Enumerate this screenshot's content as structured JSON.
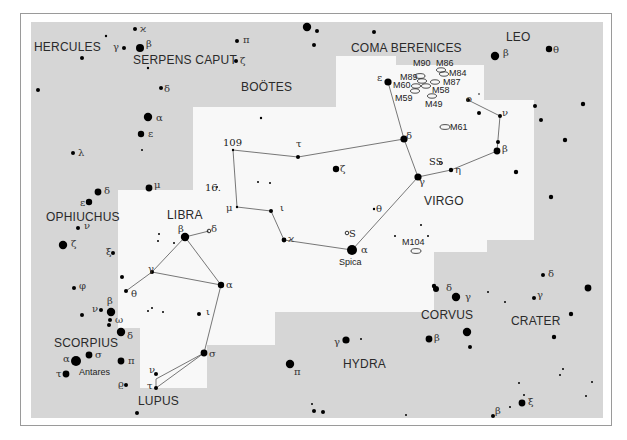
{
  "map": {
    "type": "star-chart",
    "region": "Virgo and Libra",
    "colors": {
      "background_sky": "#d6d6d6",
      "highlight_region": "#f8f8f8",
      "star": "#000000",
      "line": "#555555",
      "label": "#2a2a2a",
      "frame": "#9a9a9a"
    },
    "constellations": [
      {
        "name": "HERCULES",
        "x": 34,
        "y": 50
      },
      {
        "name": "SERPENS CAPUT",
        "x": 132,
        "y": 63
      },
      {
        "name": "BOÖTES",
        "x": 241,
        "y": 90
      },
      {
        "name": "COMA BERENICES",
        "x": 350,
        "y": 52
      },
      {
        "name": "LEO",
        "x": 505,
        "y": 40
      },
      {
        "name": "OPHIUCHUS",
        "x": 46,
        "y": 220
      },
      {
        "name": "LIBRA",
        "x": 167,
        "y": 218
      },
      {
        "name": "VIRGO",
        "x": 424,
        "y": 204
      },
      {
        "name": "SCORPIUS",
        "x": 54,
        "y": 346
      },
      {
        "name": "CORVUS",
        "x": 422,
        "y": 318
      },
      {
        "name": "CRATER",
        "x": 510,
        "y": 324
      },
      {
        "name": "HYDRA",
        "x": 343,
        "y": 367
      },
      {
        "name": "LUPUS",
        "x": 138,
        "y": 405
      }
    ],
    "star_labels": [
      {
        "text": "ϰ",
        "x": 140,
        "y": 32
      },
      {
        "text": "γ",
        "x": 113,
        "y": 50
      },
      {
        "text": "β",
        "x": 146,
        "y": 47
      },
      {
        "text": "π",
        "x": 243,
        "y": 43
      },
      {
        "text": "ζ",
        "x": 240,
        "y": 64
      },
      {
        "text": "δ",
        "x": 164,
        "y": 92
      },
      {
        "text": "α",
        "x": 156,
        "y": 121
      },
      {
        "text": "ε",
        "x": 148,
        "y": 137
      },
      {
        "text": "λ",
        "x": 78,
        "y": 156
      },
      {
        "text": "δ",
        "x": 104,
        "y": 194
      },
      {
        "text": "μ",
        "x": 154,
        "y": 188
      },
      {
        "text": "ε",
        "x": 80,
        "y": 206
      },
      {
        "text": "ν",
        "x": 84,
        "y": 229
      },
      {
        "text": "ζ",
        "x": 71,
        "y": 247
      },
      {
        "text": "ξ",
        "x": 106,
        "y": 255
      },
      {
        "text": "φ",
        "x": 79,
        "y": 289
      },
      {
        "text": "β",
        "x": 178,
        "y": 232
      },
      {
        "text": "δ",
        "x": 211,
        "y": 232
      },
      {
        "text": "γ",
        "x": 148,
        "y": 272
      },
      {
        "text": "θ",
        "x": 131,
        "y": 297
      },
      {
        "text": "α",
        "x": 226,
        "y": 288
      },
      {
        "text": "ι",
        "x": 206,
        "y": 315
      },
      {
        "text": "σ",
        "x": 209,
        "y": 357
      },
      {
        "text": "ν",
        "x": 149,
        "y": 373
      },
      {
        "text": "τ",
        "x": 147,
        "y": 389
      },
      {
        "text": "β",
        "x": 107,
        "y": 304
      },
      {
        "text": "ν",
        "x": 92,
        "y": 312
      },
      {
        "text": "ω",
        "x": 115,
        "y": 323
      },
      {
        "text": "δ",
        "x": 127,
        "y": 339
      },
      {
        "text": "σ",
        "x": 95,
        "y": 358
      },
      {
        "text": "α",
        "x": 63,
        "y": 362
      },
      {
        "text": "τ",
        "x": 56,
        "y": 377
      },
      {
        "text": "π",
        "x": 128,
        "y": 364
      },
      {
        "text": "ϱ",
        "x": 118,
        "y": 387
      },
      {
        "text": "109",
        "x": 223,
        "y": 146
      },
      {
        "text": "16.",
        "x": 205,
        "y": 191
      },
      {
        "text": "μ",
        "x": 226,
        "y": 211
      },
      {
        "text": "ι",
        "x": 280,
        "y": 211
      },
      {
        "text": "ϰ",
        "x": 288,
        "y": 242
      },
      {
        "text": "τ",
        "x": 296,
        "y": 147
      },
      {
        "text": "ζ",
        "x": 340,
        "y": 172
      },
      {
        "text": "θ",
        "x": 376,
        "y": 212
      },
      {
        "text": "S",
        "x": 349,
        "y": 237
      },
      {
        "text": "α",
        "x": 361,
        "y": 253
      },
      {
        "text": "ε",
        "x": 377,
        "y": 81
      },
      {
        "text": "δ",
        "x": 406,
        "y": 139
      },
      {
        "text": "γ",
        "x": 419,
        "y": 185
      },
      {
        "text": "SS",
        "x": 429,
        "y": 165
      },
      {
        "text": "η",
        "x": 455,
        "y": 173
      },
      {
        "text": "β",
        "x": 502,
        "y": 152
      },
      {
        "text": "ν",
        "x": 502,
        "y": 116
      },
      {
        "text": "ο",
        "x": 466,
        "y": 102
      },
      {
        "text": "β",
        "x": 503,
        "y": 56
      },
      {
        "text": "θ",
        "x": 553,
        "y": 53
      },
      {
        "text": "δ",
        "x": 446,
        "y": 291
      },
      {
        "text": "γ",
        "x": 465,
        "y": 300
      },
      {
        "text": "β",
        "x": 434,
        "y": 341
      },
      {
        "text": "δ",
        "x": 548,
        "y": 277
      },
      {
        "text": "γ",
        "x": 537,
        "y": 298
      },
      {
        "text": "γ",
        "x": 334,
        "y": 345
      },
      {
        "text": "π",
        "x": 294,
        "y": 375
      },
      {
        "text": "β",
        "x": 495,
        "y": 414
      },
      {
        "text": "ξ",
        "x": 528,
        "y": 405
      }
    ],
    "named_stars": [
      {
        "name": "Spica",
        "x": 339,
        "y": 264
      },
      {
        "name": "Antares",
        "x": 79,
        "y": 374
      }
    ],
    "deep_sky_objects": [
      {
        "label": "M90",
        "x": 413,
        "y": 66
      },
      {
        "label": "M86",
        "x": 436,
        "y": 66
      },
      {
        "label": "M84",
        "x": 449,
        "y": 76
      },
      {
        "label": "M89",
        "x": 400,
        "y": 80
      },
      {
        "label": "M87",
        "x": 443,
        "y": 85
      },
      {
        "label": "M60",
        "x": 393,
        "y": 88
      },
      {
        "label": "M58",
        "x": 432,
        "y": 93
      },
      {
        "label": "M59",
        "x": 395,
        "y": 101
      },
      {
        "label": "M49",
        "x": 425,
        "y": 107
      },
      {
        "label": "M61",
        "x": 450,
        "y": 130
      },
      {
        "label": "M104",
        "x": 402,
        "y": 245
      }
    ]
  }
}
